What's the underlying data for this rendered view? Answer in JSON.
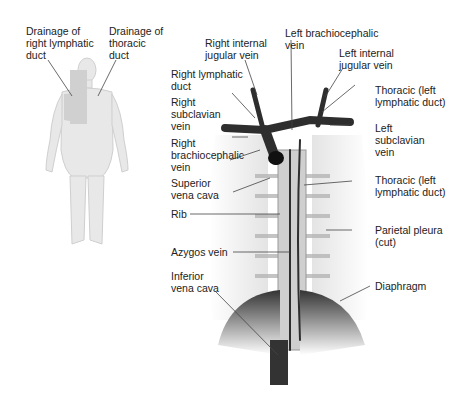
{
  "figure": {
    "left_panel": {
      "labels": {
        "drainage_right": "Drainage of\nright lymphatic\nduct",
        "drainage_thoracic": "Drainage of\nthoracic\nduct"
      }
    },
    "right_panel": {
      "labels": {
        "right_internal_jugular": "Right internal\njugular vein",
        "left_brachiocephalic": "Left brachiocephalic\nvein",
        "left_internal_jugular": "Left internal\njugular vein",
        "right_lymphatic_duct": "Right lymphatic\nduct",
        "thoracic_left_upper": "Thoracic (left\nlymphatic duct)",
        "right_subclavian": "Right\nsubclavian\nvein",
        "left_subclavian": "Left\nsubclavian\nvein",
        "right_brachiocephalic": "Right\nbrachiocephalic\nvein",
        "superior_vena_cava": "Superior\nvena cava",
        "thoracic_left_lower": "Thoracic (left\nlymphatic duct)",
        "rib": "Rib",
        "parietal_pleura": "Parietal pleura\n(cut)",
        "azygos_vein": "Azygos vein",
        "inferior_vena_cava": "Inferior\nvena cava",
        "diaphragm": "Diaphragm"
      }
    },
    "colors": {
      "vein": "#2e2e2e",
      "line": "#444444",
      "body": "#e6e6e6",
      "highlight": "#d2d2d2"
    }
  }
}
